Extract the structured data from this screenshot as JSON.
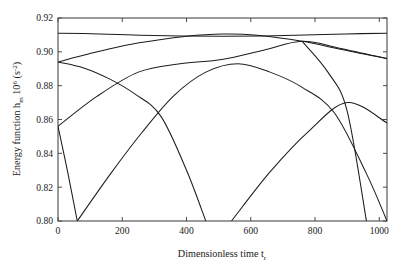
{
  "chart_data": {
    "type": "line",
    "title": "",
    "xlabel": "Dimensionless time t",
    "xlabel_sub": "r",
    "ylabel_pre": "Energy function h",
    "ylabel_sub": "m",
    "ylabel_mid": " 10",
    "ylabel_sup": "6",
    "ylabel_post": " (s",
    "ylabel_post_sup": "-2",
    "ylabel_end": ")",
    "ylabel_full": "Energy function h_m 10^6 (s^-2)",
    "xlabel_full": "Dimensionless time t_r",
    "xlim": [
      0,
      1024
    ],
    "ylim": [
      0.8,
      0.92
    ],
    "xticks": [
      0,
      200,
      400,
      600,
      800,
      1000
    ],
    "xticklabels": [
      "0",
      "200",
      "400",
      "600",
      "800",
      "1000"
    ],
    "yticks": [
      0.8,
      0.82,
      0.84,
      0.86,
      0.88,
      0.9,
      0.92
    ],
    "yticklabels": [
      "0.80",
      "0.82",
      "0.84",
      "0.86",
      "0.88",
      "0.90",
      "0.92"
    ],
    "grid": false,
    "legend": false,
    "legend_position": "none",
    "line_color": "#1c1c1c",
    "axis_color": "#4a4a4a",
    "background_color": "#ffffff",
    "series": [
      {
        "name": "curve-1",
        "amplitude": 0.0085,
        "offset": 0.9025,
        "phase_deg": 0,
        "period": 1024,
        "description": "near-flat upper curve, minimum 0.9105 at t=0 and t=1024, maximum 0.9110 mid",
        "points": [
          [
            0,
            0.911
          ],
          [
            128,
            0.9106
          ],
          [
            256,
            0.9098
          ],
          [
            384,
            0.9093
          ],
          [
            512,
            0.9092
          ],
          [
            640,
            0.9094
          ],
          [
            768,
            0.9099
          ],
          [
            896,
            0.9106
          ],
          [
            1024,
            0.911
          ]
        ]
      },
      {
        "name": "curve-2",
        "description": "rises from 0.894 at t=0 to peak ~0.9115 near t=520, falls to ~0.896 at t=1024",
        "points": [
          [
            0,
            0.894
          ],
          [
            100,
            0.899
          ],
          [
            200,
            0.9035
          ],
          [
            285,
            0.9062
          ],
          [
            400,
            0.9092
          ],
          [
            512,
            0.9105
          ],
          [
            620,
            0.9098
          ],
          [
            760,
            0.9062
          ],
          [
            880,
            0.9015
          ],
          [
            1024,
            0.896
          ]
        ]
      },
      {
        "name": "curve-3",
        "description": "falls from 0.894 at t=0 through 0.8955 crossing, down to 0.80 near t=460",
        "points": [
          [
            0,
            0.894
          ],
          [
            80,
            0.8905
          ],
          [
            160,
            0.884
          ],
          [
            240,
            0.875
          ],
          [
            320,
            0.862
          ],
          [
            400,
            0.83
          ],
          [
            460,
            0.8
          ]
        ]
      },
      {
        "name": "curve-4",
        "description": "falls from 0.856 at t=0 down to 0.80 near t=60, off bottom",
        "points": [
          [
            0,
            0.856
          ],
          [
            30,
            0.829
          ],
          [
            60,
            0.8
          ]
        ]
      },
      {
        "name": "curve-5",
        "description": "rises from 0.856 at t=0 up through 0.8955 at t=510 to peak ~0.9062 near t=760, down to 0.858 at t=1024",
        "points": [
          [
            0,
            0.856
          ],
          [
            120,
            0.8735
          ],
          [
            250,
            0.888
          ],
          [
            380,
            0.893
          ],
          [
            510,
            0.8955
          ],
          [
            640,
            0.901
          ],
          [
            760,
            0.9062
          ],
          [
            880,
            0.902
          ],
          [
            1024,
            0.896
          ]
        ]
      },
      {
        "name": "curve-6",
        "description": "enters bottom near t=60, rises to 0.8955 crossing near t=510, continues to 0.896 at right edge",
        "points": [
          [
            60,
            0.8
          ],
          [
            160,
            0.827
          ],
          [
            260,
            0.852
          ],
          [
            360,
            0.874
          ],
          [
            460,
            0.888
          ],
          [
            560,
            0.893
          ],
          [
            660,
            0.888
          ],
          [
            760,
            0.879
          ],
          [
            860,
            0.864
          ],
          [
            960,
            0.828
          ],
          [
            1024,
            0.8
          ]
        ]
      },
      {
        "name": "curve-7",
        "description": "enters bottom near t=540, rises to 0.858 at right edge t=1024",
        "points": [
          [
            540,
            0.8
          ],
          [
            660,
            0.829
          ],
          [
            780,
            0.853
          ],
          [
            900,
            0.87
          ],
          [
            1024,
            0.858
          ]
        ]
      },
      {
        "name": "curve-8",
        "description": "descends from upper right region to bottom near t=960",
        "points": [
          [
            760,
            0.9062
          ],
          [
            840,
            0.888
          ],
          [
            900,
            0.865
          ],
          [
            960,
            0.8
          ]
        ]
      }
    ]
  }
}
